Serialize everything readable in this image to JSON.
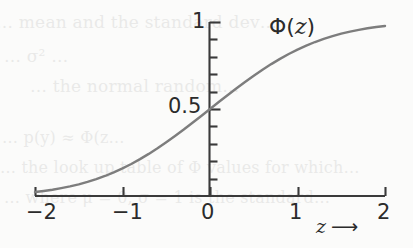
{
  "figure": {
    "kind": "scanned-book-figure",
    "background_color": "#fbfbfa",
    "curve_color": "#7d7d7d",
    "axis_color": "#3a3a3a",
    "text_color": "#2b2b2b"
  },
  "labels": {
    "y_top": "1",
    "y_mid": "0.5",
    "x_m2": "−2",
    "x_m1": "−1",
    "x_0": "0",
    "x_1": "1",
    "x_2": "2",
    "curve_label_prefix": "Φ(",
    "curve_label_var": "z",
    "curve_label_suffix": ")",
    "x_axis_name": "z",
    "x_axis_arrow": "⟶"
  },
  "ghost_text": {
    "line1": "… mean and the standard dev…",
    "line2": "… σ² …",
    "line3": "… the normal random…",
    "line4": "… p(y) ≈ Φ(z…",
    "line5": "… the look up table of Φ values for which…",
    "line6": "… where μ = 0, σ = 1 is the standard…"
  },
  "chart_data": {
    "type": "line",
    "title": "",
    "subtitle": "",
    "xlabel": "z",
    "ylabel": "Φ(z)",
    "series": [
      {
        "name": "Φ(z)",
        "description": "standard normal cumulative distribution function",
        "color": "#7d7d7d",
        "x": [
          -2.0,
          -1.9,
          -1.8,
          -1.7,
          -1.6,
          -1.5,
          -1.4,
          -1.3,
          -1.2,
          -1.1,
          -1.0,
          -0.9,
          -0.8,
          -0.7,
          -0.6,
          -0.5,
          -0.4,
          -0.3,
          -0.2,
          -0.1,
          0.0,
          0.1,
          0.2,
          0.3,
          0.4,
          0.5,
          0.6,
          0.7,
          0.8,
          0.9,
          1.0,
          1.1,
          1.2,
          1.3,
          1.4,
          1.5,
          1.6,
          1.7,
          1.8,
          1.9,
          2.0
        ],
        "y": [
          0.023,
          0.029,
          0.036,
          0.045,
          0.055,
          0.067,
          0.081,
          0.097,
          0.115,
          0.136,
          0.159,
          0.184,
          0.212,
          0.242,
          0.274,
          0.309,
          0.345,
          0.382,
          0.421,
          0.46,
          0.5,
          0.54,
          0.579,
          0.618,
          0.655,
          0.691,
          0.726,
          0.758,
          0.788,
          0.816,
          0.841,
          0.864,
          0.885,
          0.903,
          0.919,
          0.933,
          0.945,
          0.955,
          0.964,
          0.971,
          0.977
        ]
      }
    ],
    "xlim": [
      -2,
      2
    ],
    "ylim": [
      0,
      1
    ],
    "x_major_ticks": [
      -2,
      -1,
      0,
      1,
      2
    ],
    "x_major_tick_labels": [
      "−2",
      "−1",
      "0",
      "1",
      "2"
    ],
    "y_labeled_ticks": [
      0.5,
      1
    ],
    "y_labeled_tick_labels": [
      "0.5",
      "1"
    ],
    "y_minor_tick_step": 0.1,
    "grid": false,
    "legend": false,
    "annotations": [
      {
        "text": "Φ(z)",
        "x": 1.0,
        "y": 0.98,
        "role": "curve-label"
      },
      {
        "text": "z ⟶",
        "x": 1.6,
        "y": -0.12,
        "role": "x-axis-name"
      }
    ]
  }
}
